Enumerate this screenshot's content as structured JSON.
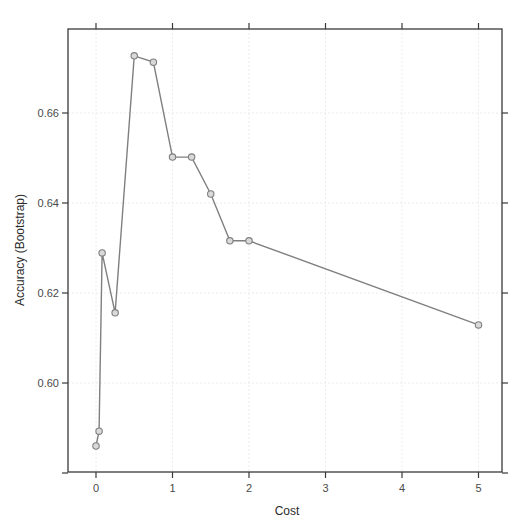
{
  "chart_data": {
    "type": "line",
    "title": "",
    "xlabel": "Cost",
    "ylabel": "Accuracy (Bootstrap)",
    "xlim": [
      -0.36,
      5.33
    ],
    "ylim": [
      0.58,
      0.6798
    ],
    "x_ticks": [
      0,
      1,
      2,
      3,
      4,
      5
    ],
    "x_tick_labels": [
      "0",
      "1",
      "2",
      "3",
      "4",
      "5"
    ],
    "y_ticks": [
      0.58,
      0.6,
      0.62,
      0.64,
      0.66
    ],
    "y_tick_labels": [
      "",
      "0.60",
      "0.62",
      "0.64",
      "0.66"
    ],
    "grid": true,
    "legend": null,
    "series": [
      {
        "name": "Accuracy",
        "marker": "circle",
        "color": "#7f7f7f",
        "x": [
          0,
          0.04,
          0.08,
          0.25,
          0.5,
          0.75,
          1.0,
          1.25,
          1.5,
          1.75,
          2.0,
          5.0
        ],
        "values": [
          0.586,
          0.5893,
          0.6289,
          0.6156,
          0.6727,
          0.6713,
          0.6502,
          0.6502,
          0.642,
          0.6316,
          0.6316,
          0.6129
        ]
      }
    ]
  },
  "colors": {
    "line": "#7f7f7f",
    "marker_fill": "#d9d9d9",
    "marker_stroke": "#7f7f7f",
    "frame": "#3a3a3a",
    "grid": "#ececec"
  }
}
